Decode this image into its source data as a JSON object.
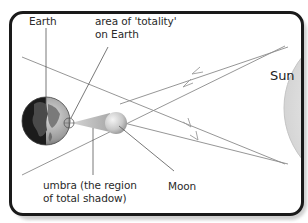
{
  "diagram": {
    "type": "solar-eclipse",
    "labels": {
      "earth": "Earth",
      "totality_line1": "area of 'totality'",
      "totality_line2": "on Earth",
      "sun": "Sun",
      "umbra_line1": "umbra (the region",
      "umbra_line2": "of total shadow)",
      "moon": "Moon"
    },
    "bodies": [
      {
        "name": "Earth",
        "shape": "sphere",
        "shading": "dark-half-facing-away"
      },
      {
        "name": "Moon",
        "shape": "sphere"
      },
      {
        "name": "Sun",
        "shape": "partial-circle-clipped-right"
      }
    ],
    "rays": {
      "count": 4,
      "direction": "from Sun toward Earth",
      "arrowheads": "pointing left"
    },
    "colors": {
      "frame_border": "#1a1a1a",
      "frame_shadow": "#cfcfcf",
      "ray_line": "#8a8a8a",
      "sun_fill": "#ececec",
      "umbra_cone": "#bdbdbd",
      "text": "#2a2a2a"
    }
  }
}
